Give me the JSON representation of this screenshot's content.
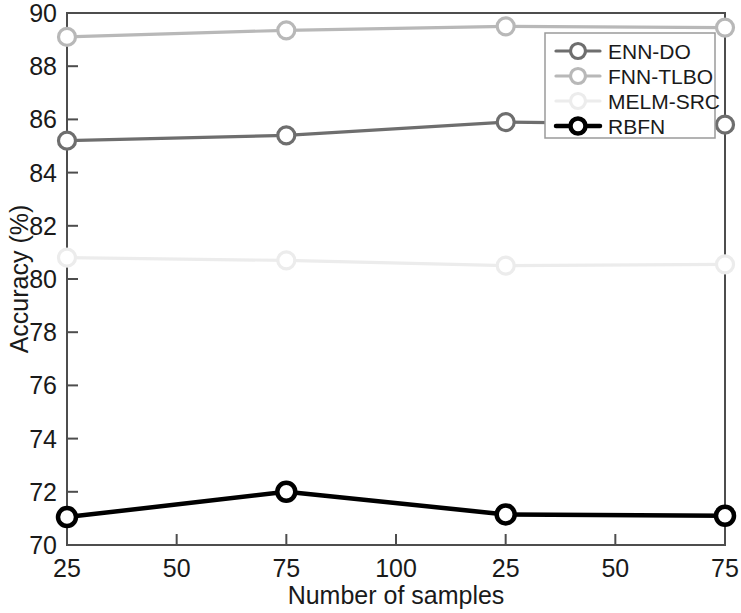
{
  "chart_data": {
    "type": "line",
    "title": "",
    "xlabel": "Number of samples",
    "ylabel": "Accuracy (%)",
    "xtick_labels": [
      "25",
      "50",
      "75",
      "100",
      "25",
      "50",
      "75"
    ],
    "ytick_labels": [
      "70",
      "72",
      "74",
      "76",
      "78",
      "80",
      "82",
      "84",
      "86",
      "88",
      "90"
    ],
    "ylim": [
      70,
      90
    ],
    "xlim": [
      0,
      6
    ],
    "grid": false,
    "legend_position": "upper-right-inside",
    "x": [
      0,
      2,
      4,
      6
    ],
    "x_marker_labels": [
      "25",
      "75",
      "25",
      "75"
    ],
    "series": [
      {
        "name": "ENN-DO",
        "color": "#6e6e6e",
        "marker": "circle",
        "values": [
          85.2,
          85.4,
          85.9,
          85.8
        ]
      },
      {
        "name": "FNN-TLBO",
        "color": "#b8b8b8",
        "marker": "circle",
        "values": [
          89.1,
          89.35,
          89.5,
          89.45
        ]
      },
      {
        "name": "MELM-SRC",
        "color": "#ececec",
        "marker": "circle",
        "values": [
          80.8,
          80.7,
          80.5,
          80.55
        ]
      },
      {
        "name": "RBFN",
        "color": "#000000",
        "marker": "circle",
        "values": [
          71.05,
          72.0,
          71.15,
          71.1
        ]
      }
    ]
  },
  "axes": {
    "x_title": "Number of samples",
    "y_title": "Accuracy (%)",
    "x_ticks": [
      "25",
      "50",
      "75",
      "100",
      "25",
      "50",
      "75"
    ],
    "y_ticks": [
      "90",
      "88",
      "86",
      "84",
      "82",
      "80",
      "78",
      "76",
      "74",
      "72",
      "70"
    ]
  },
  "legend": {
    "items": [
      {
        "label": "ENN-DO",
        "color": "#6e6e6e"
      },
      {
        "label": "FNN-TLBO",
        "color": "#b8b8b8"
      },
      {
        "label": "MELM-SRC",
        "color": "#ececec"
      },
      {
        "label": "RBFN",
        "color": "#000000"
      }
    ]
  }
}
